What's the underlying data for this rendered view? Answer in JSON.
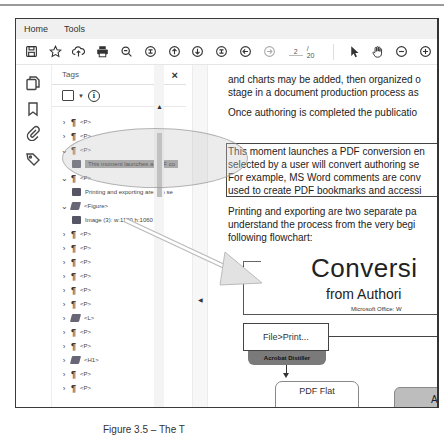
{
  "window": {
    "tabs": [
      {
        "label": "Home"
      },
      {
        "label": "Tools"
      },
      {
        "label": "Chapter_3SampleT...",
        "close": "×",
        "active": true
      }
    ]
  },
  "toolbar": {
    "icons": [
      "save-icon",
      "bookmark-star-icon",
      "upload-cloud-icon",
      "print-icon",
      "zoom-out-search-icon",
      "fit-page-icon",
      "prev-page-icon",
      "next-page-icon",
      "fit-width-icon",
      "back-icon",
      "forward-icon"
    ],
    "page_current": "2",
    "page_total": "/ 20",
    "right_icons": [
      "select-cursor-icon",
      "hand-tool-icon",
      "zoom-out-icon",
      "zoom-in-icon"
    ]
  },
  "rail": {
    "icons": [
      "pages-icon",
      "bookmarks-icon",
      "attachments-icon",
      "tags-icon"
    ]
  },
  "tags_panel": {
    "title": "Tags",
    "close": "×",
    "tree": [
      {
        "chevron": ">",
        "icon": "pilcrow",
        "label": "<P>",
        "indent": 0
      },
      {
        "chevron": ">",
        "icon": "pilcrow",
        "label": "<P>",
        "indent": 0
      },
      {
        "chevron": "v",
        "icon": "pilcrow",
        "label": "<P>",
        "indent": 0
      },
      {
        "chevron": "",
        "icon": "content",
        "label": "This moment launches a PDF co",
        "indent": 1,
        "selected": true
      },
      {
        "chevron": "v",
        "icon": "pilcrow",
        "label": "<P>",
        "indent": 0
      },
      {
        "chevron": "",
        "icon": "content",
        "label": "Printing and exporting are two se",
        "indent": 1
      },
      {
        "chevron": "v",
        "icon": "tag",
        "label": "<Figure>",
        "indent": 0
      },
      {
        "chevron": "",
        "icon": "content",
        "label": "Image (3): w:1100 h:1060",
        "indent": 1
      },
      {
        "chevron": ">",
        "icon": "pilcrow",
        "label": "<P>",
        "indent": 0
      },
      {
        "chevron": ">",
        "icon": "pilcrow",
        "label": "<P>",
        "indent": 0
      },
      {
        "chevron": ">",
        "icon": "pilcrow",
        "label": "<P>",
        "indent": 0
      },
      {
        "chevron": ">",
        "icon": "pilcrow",
        "label": "<P>",
        "indent": 0
      },
      {
        "chevron": ">",
        "icon": "pilcrow",
        "label": "<P>",
        "indent": 0
      },
      {
        "chevron": ">",
        "icon": "pilcrow",
        "label": "<P>",
        "indent": 0
      },
      {
        "chevron": ">",
        "icon": "tag",
        "label": "<L>",
        "indent": 0
      },
      {
        "chevron": ">",
        "icon": "pilcrow",
        "label": "<P>",
        "indent": 0
      },
      {
        "chevron": ">",
        "icon": "pilcrow",
        "label": "<P>",
        "indent": 0
      },
      {
        "chevron": ">",
        "icon": "tag",
        "label": "<H1>",
        "indent": 0
      },
      {
        "chevron": ">",
        "icon": "pilcrow",
        "label": "<P>",
        "indent": 0
      },
      {
        "chevron": ">",
        "icon": "pilcrow",
        "label": "<P>",
        "indent": 0
      }
    ]
  },
  "document": {
    "lines": [
      "and charts may be added, then organized o",
      "stage in a document production process as",
      "Once authoring is completed the publicatio",
      "This moment launches a PDF conversion en",
      "selected by a user will convert authoring se",
      "For example, MS Word comments are conv",
      "used to create PDF bookmarks and accessi",
      "Printing and exporting are two separate pa",
      "understand the process from the very begi",
      "following flowchart:"
    ],
    "flowchart": {
      "title": "Conversi",
      "subtitle": "from Authori",
      "ms_office": "Microsoft Office: W",
      "print_box": "File>Print...",
      "distiller": "Acrobat Distiller",
      "pdf_flat": "PDF Flat",
      "acr": "ACR"
    }
  },
  "caption": "Figure 3.5 – The T"
}
